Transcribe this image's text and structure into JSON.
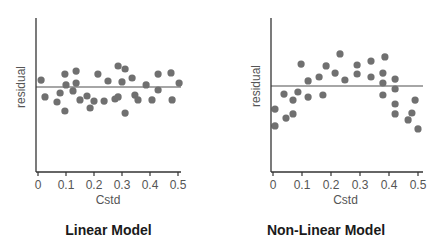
{
  "chart_data": [
    {
      "type": "scatter",
      "title": "Linear Model",
      "xlabel": "Cstd",
      "ylabel": "residual",
      "x_ticks": [
        "0",
        "0.1",
        "0.2",
        "0.3",
        "0.4",
        "0.5"
      ],
      "xlim": [
        0,
        0.52
      ],
      "ylim": [
        -2.9,
        2.3
      ],
      "grid": false,
      "reference_line": {
        "y": 0,
        "color": "#888888"
      },
      "marker_color": "#707070",
      "points": [
        {
          "x": 0.011,
          "y": 0.23
        },
        {
          "x": 0.025,
          "y": -0.33
        },
        {
          "x": 0.068,
          "y": -0.5
        },
        {
          "x": 0.079,
          "y": -0.2
        },
        {
          "x": 0.096,
          "y": 0.43
        },
        {
          "x": 0.096,
          "y": -0.8
        },
        {
          "x": 0.1,
          "y": 0.07
        },
        {
          "x": 0.125,
          "y": -0.13
        },
        {
          "x": 0.136,
          "y": 0.53
        },
        {
          "x": 0.136,
          "y": 0.13
        },
        {
          "x": 0.15,
          "y": -0.43
        },
        {
          "x": 0.175,
          "y": -0.3
        },
        {
          "x": 0.186,
          "y": -0.7
        },
        {
          "x": 0.2,
          "y": -0.47
        },
        {
          "x": 0.214,
          "y": 0.43
        },
        {
          "x": 0.236,
          "y": -0.47
        },
        {
          "x": 0.25,
          "y": 0.2
        },
        {
          "x": 0.275,
          "y": -0.4
        },
        {
          "x": 0.286,
          "y": 0.7
        },
        {
          "x": 0.286,
          "y": -0.33
        },
        {
          "x": 0.3,
          "y": 0.17
        },
        {
          "x": 0.311,
          "y": 0.6
        },
        {
          "x": 0.311,
          "y": -0.87
        },
        {
          "x": 0.336,
          "y": 0.3
        },
        {
          "x": 0.346,
          "y": -0.27
        },
        {
          "x": 0.357,
          "y": -0.43
        },
        {
          "x": 0.386,
          "y": 0.07
        },
        {
          "x": 0.407,
          "y": -0.43
        },
        {
          "x": 0.429,
          "y": 0.43
        },
        {
          "x": 0.429,
          "y": -0.1
        },
        {
          "x": 0.475,
          "y": 0.47
        },
        {
          "x": 0.479,
          "y": -0.43
        },
        {
          "x": 0.504,
          "y": 0.13
        }
      ]
    },
    {
      "type": "scatter",
      "title": "Non-Linear Model",
      "xlabel": "Cstd",
      "ylabel": "residual",
      "x_ticks": [
        "0",
        "0.1",
        "0.2",
        "0.3",
        "0.4",
        "0.5"
      ],
      "xlim": [
        0,
        0.52
      ],
      "ylim": [
        -2.9,
        2.3
      ],
      "grid": false,
      "reference_line": {
        "y": 0,
        "color": "#888888"
      },
      "marker_color": "#707070",
      "points": [
        {
          "x": 0.007,
          "y": -0.77
        },
        {
          "x": 0.007,
          "y": -1.33
        },
        {
          "x": 0.038,
          "y": -0.27
        },
        {
          "x": 0.045,
          "y": -1.07
        },
        {
          "x": 0.069,
          "y": -0.47
        },
        {
          "x": 0.069,
          "y": -0.93
        },
        {
          "x": 0.086,
          "y": -0.2
        },
        {
          "x": 0.097,
          "y": 0.73
        },
        {
          "x": 0.121,
          "y": 0.17
        },
        {
          "x": 0.121,
          "y": -0.37
        },
        {
          "x": 0.159,
          "y": 0.3
        },
        {
          "x": 0.172,
          "y": -0.3
        },
        {
          "x": 0.183,
          "y": 0.67
        },
        {
          "x": 0.214,
          "y": 0.43
        },
        {
          "x": 0.231,
          "y": 1.07
        },
        {
          "x": 0.248,
          "y": 0.2
        },
        {
          "x": 0.29,
          "y": 0.7
        },
        {
          "x": 0.29,
          "y": 0.4
        },
        {
          "x": 0.338,
          "y": 0.83
        },
        {
          "x": 0.338,
          "y": 0.3
        },
        {
          "x": 0.379,
          "y": 0.43
        },
        {
          "x": 0.379,
          "y": 0.1
        },
        {
          "x": 0.379,
          "y": -0.3
        },
        {
          "x": 0.386,
          "y": 0.97
        },
        {
          "x": 0.421,
          "y": 0.23
        },
        {
          "x": 0.421,
          "y": -0.1
        },
        {
          "x": 0.421,
          "y": -0.6
        },
        {
          "x": 0.421,
          "y": -0.93
        },
        {
          "x": 0.466,
          "y": -1.13
        },
        {
          "x": 0.479,
          "y": -0.9
        },
        {
          "x": 0.49,
          "y": -0.47
        },
        {
          "x": 0.5,
          "y": -1.43
        }
      ]
    }
  ]
}
